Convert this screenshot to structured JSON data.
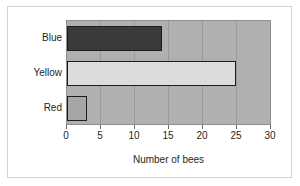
{
  "chart_data": {
    "type": "bar",
    "orientation": "horizontal",
    "title": "",
    "xlabel": "Number of bees",
    "ylabel": "",
    "categories": [
      "Blue",
      "Yellow",
      "Red"
    ],
    "values": [
      14,
      25,
      3
    ],
    "series": [
      {
        "name": "Number of bees",
        "values": [
          14,
          25,
          3
        ]
      }
    ],
    "bars": [
      {
        "category": "Blue",
        "value": 14,
        "fill": "#3a3a3a",
        "edge": "#1d1d1d"
      },
      {
        "category": "Yellow",
        "value": 25,
        "fill": "#dcdcdc",
        "edge": "#1d1d1d"
      },
      {
        "category": "Red",
        "value": 3,
        "fill": "#a6a6a6",
        "edge": "#1d1d1d"
      }
    ],
    "xlim": [
      0,
      30
    ],
    "xticks": [
      0,
      5,
      10,
      15,
      20,
      25,
      30
    ],
    "xtick_labels": [
      "0",
      "5",
      "10",
      "15",
      "20",
      "25",
      "30"
    ],
    "grid": {
      "vertical": true,
      "horizontal": false,
      "color": "#9a9a9a"
    },
    "legend": {
      "visible": false,
      "position": "none",
      "entries": []
    },
    "plot_background": "#b0b0b0",
    "figure_background": "#ffffff",
    "frame_color": "#d2d2d2",
    "text_color": "#1f1f1f"
  }
}
